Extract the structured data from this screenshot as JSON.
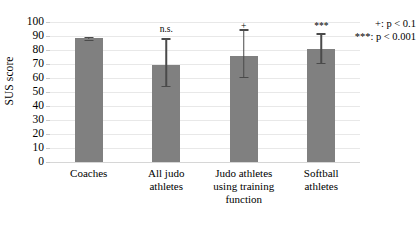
{
  "chart_data": {
    "type": "bar",
    "title": "",
    "xlabel": "",
    "ylabel": "SUS score",
    "ylim": [
      0,
      100
    ],
    "ytick_step": 10,
    "yticks": [
      "100",
      "90",
      "80",
      "70",
      "60",
      "50",
      "40",
      "30",
      "20",
      "10",
      "0"
    ],
    "grid": true,
    "legend_position": "top-right",
    "categories": [
      "Coaches",
      "All judo athletes",
      "Judo athletes using training function",
      "Softball athletes"
    ],
    "category_lines": [
      [
        "Coaches"
      ],
      [
        "All judo",
        "athletes"
      ],
      [
        "Judo athletes",
        "using training",
        "function"
      ],
      [
        "Softball",
        "athletes"
      ]
    ],
    "values": [
      88.5,
      69,
      76,
      81
    ],
    "error_low": [
      87.5,
      54.5,
      61,
      71
    ],
    "error_high": [
      89.5,
      88.5,
      95,
      92
    ],
    "annotations": [
      "",
      "n.s.",
      "+",
      "***"
    ],
    "bar_color": "#808080",
    "error_color": "#4a4a4a"
  },
  "legend": {
    "lines": [
      "+: p < 0.1",
      "***: p < 0.001"
    ]
  }
}
